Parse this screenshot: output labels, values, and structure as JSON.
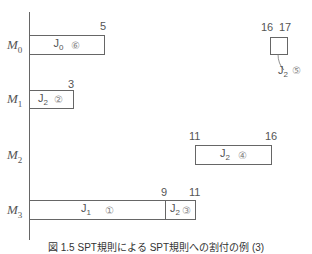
{
  "diagram": {
    "type": "gantt",
    "machines": [
      {
        "label": "M",
        "sub": "0"
      },
      {
        "label": "M",
        "sub": "1"
      },
      {
        "label": "M",
        "sub": "2"
      },
      {
        "label": "M",
        "sub": "3"
      }
    ],
    "tasks": [
      {
        "machine": "M0",
        "job": "J",
        "job_sub": "0",
        "order": "⑥",
        "start": 0,
        "end": 5,
        "end_label": "5"
      },
      {
        "machine": "M0",
        "job": "J",
        "job_sub": "2",
        "order": "⑤",
        "start": 16,
        "end": 17,
        "start_label": "16",
        "end_label": "17"
      },
      {
        "machine": "M1",
        "job": "J",
        "job_sub": "2",
        "order": "②",
        "start": 0,
        "end": 3,
        "end_label": "3"
      },
      {
        "machine": "M2",
        "job": "J",
        "job_sub": "2",
        "order": "④",
        "start": 11,
        "end": 16,
        "start_label": "11",
        "end_label": "16"
      },
      {
        "machine": "M3",
        "job": "J",
        "job_sub": "1",
        "order": "①",
        "start": 0,
        "end": 9,
        "end_label": "9"
      },
      {
        "machine": "M3",
        "job": "J",
        "job_sub": "2",
        "order": "③",
        "start": 9,
        "end": 11,
        "end_label": "11"
      }
    ],
    "caption": "図 1.5 SPT規則による SPT規則への割付の例 (3)"
  }
}
